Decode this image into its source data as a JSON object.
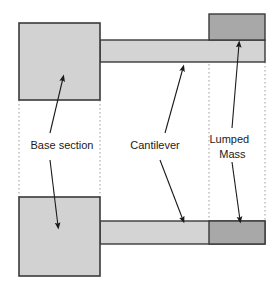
{
  "diagram": {
    "background": "#ffffff",
    "width": 279,
    "height": 289,
    "colors": {
      "base_fill": "#d2d2d2",
      "beam_fill": "#d4d4d4",
      "mass_fill": "#a8a8a8",
      "outline": "#3a3a3a",
      "guide_line": "#9a9a9a",
      "arrow": "#1a1a1a",
      "text": "#1a1a1a"
    },
    "labels": [
      {
        "id": "base-section",
        "text": "Base section",
        "lines": [
          "Base section"
        ],
        "x": 62,
        "y": 146
      },
      {
        "id": "cantilever",
        "text": "Cantilever",
        "lines": [
          "Cantilever"
        ],
        "x": 155,
        "y": 146
      },
      {
        "id": "lumped-mass",
        "text": "Lumped Mass",
        "lines": [
          "Lumped",
          "Mass"
        ],
        "x": 240,
        "y": 140
      }
    ],
    "shapes": {
      "base_top": {
        "x": 19,
        "y": 23,
        "width": 81,
        "height": 77
      },
      "base_bottom": {
        "x": 19,
        "y": 197,
        "width": 81,
        "height": 79
      },
      "beam_top": {
        "x": 100,
        "y": 40,
        "width": 165,
        "height": 22
      },
      "beam_bottom": {
        "x": 100,
        "y": 221,
        "width": 165,
        "height": 23
      },
      "mass_top": {
        "x": 209,
        "y": 14,
        "width": 56,
        "height": 26
      },
      "mass_bottom": {
        "x": 209,
        "y": 221,
        "width": 56,
        "height": 23
      }
    },
    "guide_lines": [
      {
        "id": "guide-left-base",
        "x": 19,
        "y1": 100,
        "y2": 197
      },
      {
        "id": "guide-right-base",
        "x": 100,
        "y1": 100,
        "y2": 197
      },
      {
        "id": "guide-mass-left",
        "x": 209,
        "y1": 40,
        "y2": 221
      },
      {
        "id": "guide-mass-right",
        "x": 265,
        "y1": 62,
        "y2": 221
      }
    ],
    "leaders": [
      {
        "id": "leader-base-up",
        "x1": 50,
        "y1": 133,
        "x2": 63,
        "y2": 76,
        "target": "base_top"
      },
      {
        "id": "leader-base-down",
        "x1": 50,
        "y1": 160,
        "x2": 58,
        "y2": 228,
        "target": "base_bottom"
      },
      {
        "id": "leader-cantilever-up",
        "x1": 165,
        "y1": 133,
        "x2": 183,
        "y2": 66,
        "target": "beam_top"
      },
      {
        "id": "leader-cantilever-down",
        "x1": 160,
        "y1": 160,
        "x2": 183,
        "y2": 222,
        "target": "beam_bottom"
      },
      {
        "id": "leader-mass-up",
        "x1": 232,
        "y1": 128,
        "x2": 239,
        "y2": 42,
        "target": "mass_top"
      },
      {
        "id": "leader-mass-down",
        "x1": 232,
        "y1": 162,
        "x2": 240,
        "y2": 222,
        "target": "mass_bottom"
      }
    ]
  }
}
